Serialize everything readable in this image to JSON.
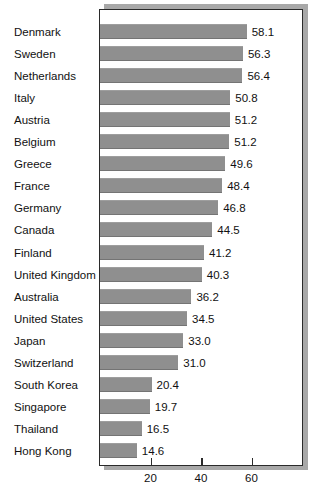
{
  "chart_data": {
    "type": "bar",
    "orientation": "horizontal",
    "title": "",
    "subtitle": "",
    "xlabel": "",
    "ylabel": "",
    "xlim": [
      0,
      80
    ],
    "grid": false,
    "legend": null,
    "axis_ticks": [
      "20",
      "40",
      "60"
    ],
    "axis_tick_values": [
      20,
      40,
      60
    ],
    "categories": [
      "Denmark",
      "Sweden",
      "Netherlands",
      "Italy",
      "Austria",
      "Belgium",
      "Greece",
      "France",
      "Germany",
      "Canada",
      "Finland",
      "United Kingdom",
      "Australia",
      "United States",
      "Japan",
      "Switzerland",
      "South Korea",
      "Singapore",
      "Thailand",
      "Hong Kong"
    ],
    "values": [
      58.1,
      56.3,
      56.4,
      50.8,
      51.2,
      51.2,
      49.6,
      48.4,
      46.8,
      44.5,
      41.2,
      40.3,
      36.2,
      34.5,
      33.0,
      31.0,
      20.4,
      19.7,
      16.5,
      14.6
    ],
    "value_labels": [
      "58.1",
      "56.3",
      "56.4",
      "50.8",
      "51.2",
      "51.2",
      "49.6",
      "48.4",
      "46.8",
      "44.5",
      "41.2",
      "40.3",
      "36.2",
      "34.5",
      "33.0",
      "31.0",
      "20.4",
      "19.7",
      "16.5",
      "14.6"
    ],
    "bar_lengths": [
      58.1,
      56.6,
      56.4,
      51.6,
      51.4,
      51.2,
      49.6,
      48.4,
      46.8,
      44.5,
      41.2,
      40.3,
      36.2,
      34.5,
      33.0,
      31.0,
      20.4,
      19.7,
      16.5,
      14.6
    ],
    "colors": {
      "bar_fill": "#8f8f8f",
      "frame": "#2a2a2a",
      "shadow": "#a8a8a8",
      "background": "#ffffff",
      "text": "#111111"
    }
  }
}
